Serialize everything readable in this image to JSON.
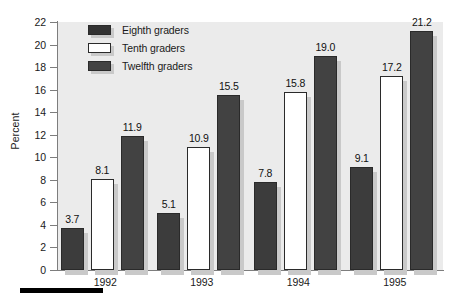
{
  "chart_data": {
    "type": "bar",
    "title": "",
    "subtitle": "",
    "xlabel": "",
    "ylabel": "Percent",
    "categories": [
      "1992",
      "1993",
      "1994",
      "1995"
    ],
    "series": [
      {
        "name": "Eighth graders",
        "color": "#3c3c3c",
        "values": [
          3.7,
          5.1,
          7.8,
          9.1
        ]
      },
      {
        "name": "Tenth graders",
        "color": "#ffffff",
        "values": [
          8.1,
          10.9,
          15.8,
          17.2
        ]
      },
      {
        "name": "Twelfth graders",
        "color": "#424242",
        "values": [
          11.9,
          15.5,
          19.0,
          21.2
        ]
      }
    ],
    "data_labels": [
      [
        "3.7",
        "8.1",
        "11.9"
      ],
      [
        "5.1",
        "10.9",
        "15.5"
      ],
      [
        "7.8",
        "15.8",
        "19.0"
      ],
      [
        "9.1",
        "17.2",
        "21.2"
      ]
    ],
    "ylim": [
      0,
      22
    ],
    "ytick_labels": [
      "22",
      "20",
      "18",
      "16",
      "14",
      "12",
      "10",
      "8",
      "6",
      "4",
      "2",
      "0"
    ],
    "ytick_values": [
      22,
      20,
      18,
      16,
      14,
      12,
      10,
      8,
      6,
      4,
      2,
      0
    ],
    "grid": false,
    "legend_position": "top-left-inside",
    "plot_background": "#ebebeb",
    "axis_color": "#7d7d7d",
    "bar_shadow_color": "#c9c9c9"
  },
  "legend": {
    "entries": [
      {
        "label": "Eighth graders"
      },
      {
        "label": "Tenth graders"
      },
      {
        "label": "Twelfth graders"
      }
    ]
  },
  "axes": {
    "y_title": "Percent",
    "y_ticks": [
      "22",
      "20",
      "18",
      "16",
      "14",
      "12",
      "10",
      "8",
      "6",
      "4",
      "2",
      "0"
    ],
    "x_ticks": [
      "1992",
      "1993",
      "1994",
      "1995"
    ]
  },
  "values": {
    "g0": {
      "v0": "3.7",
      "v1": "8.1",
      "v2": "11.9"
    },
    "g1": {
      "v0": "5.1",
      "v1": "10.9",
      "v2": "15.5"
    },
    "g2": {
      "v0": "7.8",
      "v1": "15.8",
      "v2": "19.0"
    },
    "g3": {
      "v0": "9.1",
      "v1": "17.2",
      "v2": "21.2"
    }
  }
}
